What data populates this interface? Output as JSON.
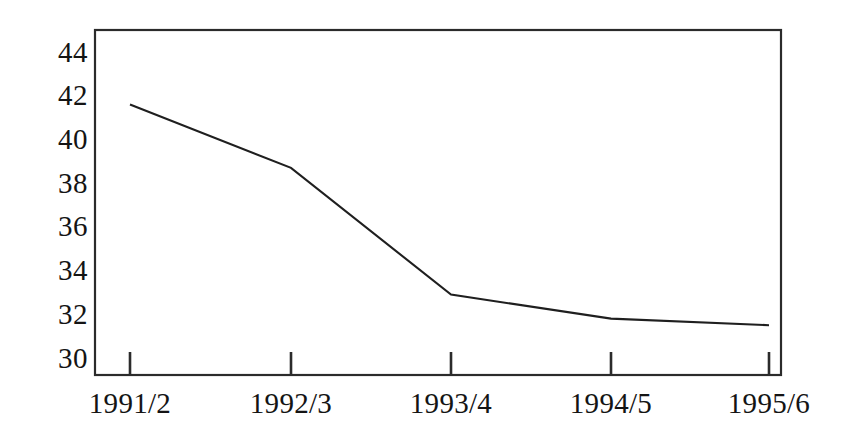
{
  "chart_data": {
    "type": "line",
    "title": "",
    "subtitle": "",
    "xlabel": "",
    "ylabel": "",
    "categories": [
      "1991/2",
      "1992/3",
      "1993/4",
      "1994/5",
      "1995/6"
    ],
    "series": [
      {
        "name": "",
        "values": [
          41.6,
          38.7,
          32.9,
          31.8,
          31.5
        ]
      }
    ],
    "y_ticks": [
      44,
      42,
      40,
      38,
      36,
      34,
      32,
      30
    ],
    "ylim": [
      30,
      45
    ],
    "xlim": [
      0,
      5
    ],
    "grid": false,
    "legend": false,
    "legend_position": "none",
    "annotations": [],
    "colors": {
      "line": "#1f1f1f",
      "frame": "#2b2b2b",
      "text": "#141414",
      "background": "#ffffff"
    }
  },
  "axes": {
    "y_labels": [
      "44",
      "42",
      "40",
      "38",
      "36",
      "34",
      "32",
      "30"
    ],
    "x_labels": [
      "1991/2",
      "1992/3",
      "1993/4",
      "1994/5",
      "1995/6"
    ]
  }
}
